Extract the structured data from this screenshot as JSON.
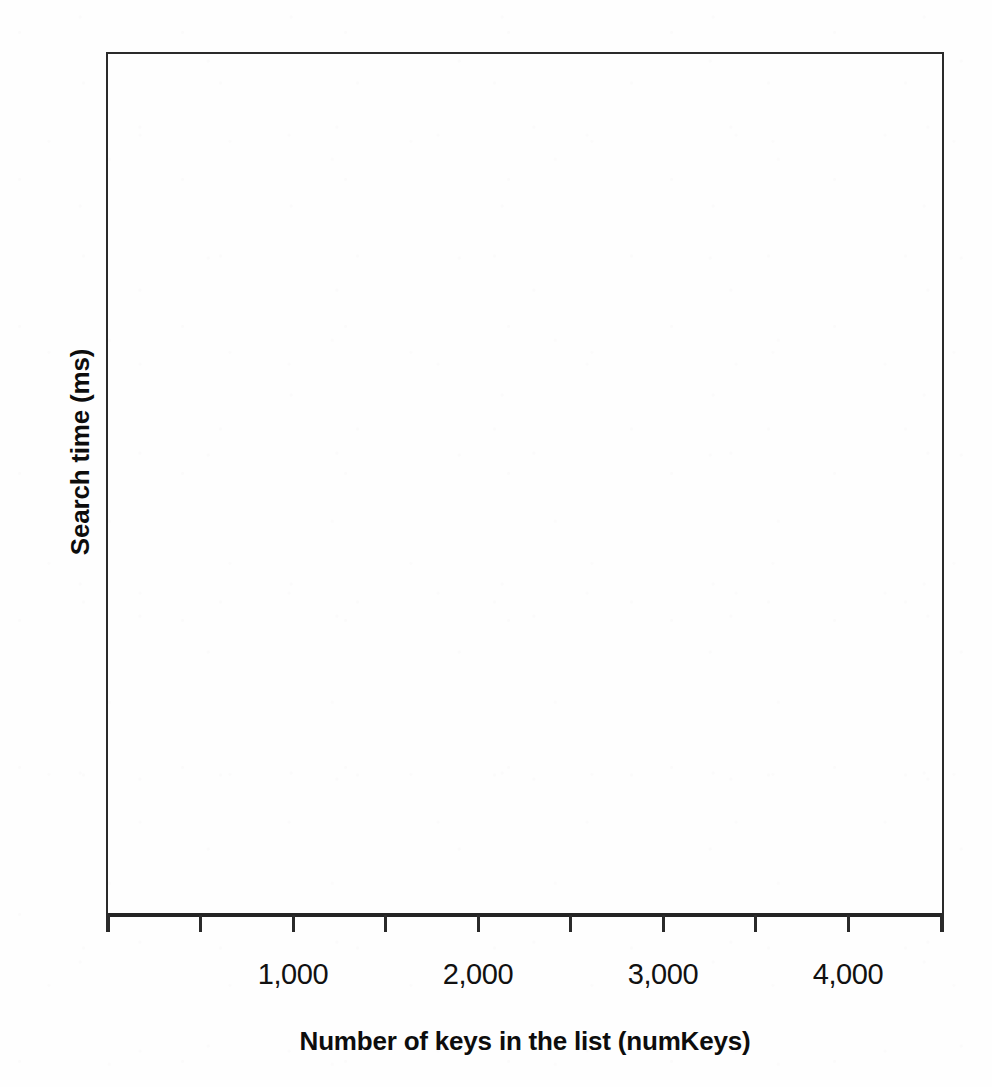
{
  "chart_data": {
    "type": "line",
    "title": "",
    "subtitle": "",
    "xlabel": "Number of keys in the list (numKeys)",
    "ylabel": "Search time (ms)",
    "x_tick_labels": [
      "1,000",
      "2,000",
      "3,000",
      "4,000"
    ],
    "x_tick_values": [
      1000,
      2000,
      3000,
      4000
    ],
    "y_tick_labels": [],
    "y_tick_values": [],
    "xlim": [
      0,
      4500
    ],
    "ylim": [
      0,
      0
    ],
    "grid": false,
    "legend": null,
    "legend_position": "none",
    "series": [],
    "values": [],
    "categories": [],
    "annotations": [],
    "note": "Blank axes: the plot interior contains no plotted data, no gridlines and no y-axis tick labels.",
    "minor_x_ticks_count": 10,
    "axis_frame": "full box border on all four sides",
    "colors": {
      "axis": "#2a2a2a",
      "text": "#0d0d0d",
      "background": "#fefefe"
    }
  },
  "figure": {
    "x_axis": {
      "title": "Number of keys in the list (numKeys)",
      "ticks": [
        {
          "label": "",
          "labeled": false,
          "x": 108
        },
        {
          "label": "",
          "labeled": false,
          "x": 200
        },
        {
          "label": "1,000",
          "labeled": true,
          "x": 293
        },
        {
          "label": "",
          "labeled": false,
          "x": 385
        },
        {
          "label": "2,000",
          "labeled": true,
          "x": 478
        },
        {
          "label": "",
          "labeled": false,
          "x": 570
        },
        {
          "label": "3,000",
          "labeled": true,
          "x": 663
        },
        {
          "label": "",
          "labeled": false,
          "x": 755
        },
        {
          "label": "4,000",
          "labeled": true,
          "x": 848
        },
        {
          "label": "",
          "labeled": false,
          "x": 941
        }
      ]
    },
    "y_axis": {
      "title": "Search time (ms)",
      "ticks": []
    }
  }
}
